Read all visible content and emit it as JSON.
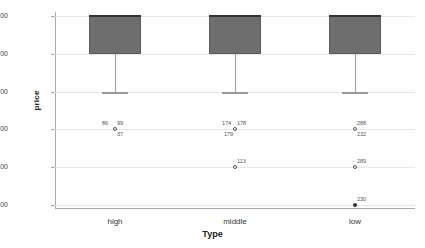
{
  "chart_data": {
    "type": "box",
    "title": "",
    "xlabel": "Type",
    "ylabel": "price",
    "categories": [
      "high",
      "middle",
      "low"
    ],
    "ylim": [
      2.0,
      7.0
    ],
    "yticks": [
      "2.00",
      "3.00",
      "4.00",
      "5.00",
      "6.00",
      "7.00"
    ],
    "grid": true,
    "legend": "none",
    "colors": {
      "box_fill": "#6e6e6e",
      "box_edge": "#5a5a5a",
      "median": "#333333",
      "whisker": "#9a9a9a",
      "gridline": "#e6e6e6",
      "axis": "#a8a8a8"
    },
    "boxes": [
      {
        "category": "high",
        "q1": 6.0,
        "median": 7.0,
        "q3": 7.0,
        "whisker_low": 5.0,
        "whisker_high": 7.0,
        "outliers": [
          {
            "value": 4.0,
            "labels": [
              "86",
              "99",
              "37"
            ],
            "marker": "open"
          }
        ]
      },
      {
        "category": "middle",
        "q1": 6.0,
        "median": 7.0,
        "q3": 7.0,
        "whisker_low": 5.0,
        "whisker_high": 7.0,
        "outliers": [
          {
            "value": 4.0,
            "labels": [
              "174",
              "178",
              "179"
            ],
            "marker": "open"
          },
          {
            "value": 3.0,
            "labels": [
              "113"
            ],
            "marker": "open"
          }
        ]
      },
      {
        "category": "low",
        "q1": 6.0,
        "median": 7.0,
        "q3": 7.0,
        "whisker_low": 5.0,
        "whisker_high": 7.0,
        "outliers": [
          {
            "value": 4.0,
            "labels": [
              "288",
              "232"
            ],
            "marker": "open"
          },
          {
            "value": 3.0,
            "labels": [
              "289"
            ],
            "marker": "open"
          },
          {
            "value": 2.0,
            "labels": [
              "230"
            ],
            "marker": "filled"
          }
        ]
      }
    ],
    "outlier_annotations": [
      {
        "category": "high",
        "value": 4.0,
        "text": "86",
        "position": "above-left"
      },
      {
        "category": "high",
        "value": 4.0,
        "text": "99",
        "position": "above-right"
      },
      {
        "category": "high",
        "value": 4.0,
        "text": "37",
        "position": "below-right"
      },
      {
        "category": "middle",
        "value": 4.0,
        "text": "174",
        "position": "above-left"
      },
      {
        "category": "middle",
        "value": 4.0,
        "text": "178",
        "position": "above-right"
      },
      {
        "category": "middle",
        "value": 4.0,
        "text": "179",
        "position": "below-left"
      },
      {
        "category": "middle",
        "value": 3.0,
        "text": "113",
        "position": "above-right"
      },
      {
        "category": "low",
        "value": 4.0,
        "text": "288",
        "position": "above-right"
      },
      {
        "category": "low",
        "value": 4.0,
        "text": "232",
        "position": "below-right"
      },
      {
        "category": "low",
        "value": 3.0,
        "text": "289",
        "position": "above-right"
      },
      {
        "category": "low",
        "value": 2.0,
        "text": "230",
        "position": "above-right"
      }
    ]
  },
  "axis": {
    "y_title": "price",
    "x_title": "Type",
    "y_tick_labels": [
      "7.00",
      "6.00",
      "5.00",
      "4.00",
      "3.00",
      "2.00"
    ],
    "x_tick_labels": [
      "high",
      "middle",
      "low"
    ]
  }
}
